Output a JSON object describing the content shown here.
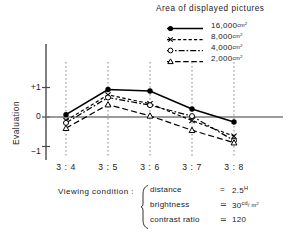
{
  "legend": {
    "title": "Area of displayed pictures",
    "entries": [
      {
        "label": "16,000",
        "unit": "cm",
        "unit_exp": "2",
        "marker": "filled-circle",
        "line_style": "solid",
        "color": "#000000"
      },
      {
        "label": "8,000",
        "unit": "cm",
        "unit_exp": "2",
        "marker": "cross",
        "line_style": "dashed",
        "color": "#000000"
      },
      {
        "label": "4,000",
        "unit": "cm",
        "unit_exp": "2",
        "marker": "open-circle",
        "line_style": "dash-dot",
        "color": "#000000"
      },
      {
        "label": "2,000",
        "unit": "cm",
        "unit_exp": "2",
        "marker": "open-triangle",
        "line_style": "long-dash",
        "color": "#000000"
      }
    ]
  },
  "axes": {
    "y_title": "Evaluation",
    "y_ticks": [
      "+1",
      "0",
      "−1"
    ],
    "y_tick_values": [
      1,
      0,
      -1
    ],
    "x_ticks": [
      "3 : 4",
      "3 : 5",
      "3 : 6",
      "3 : 7",
      "3 : 8"
    ]
  },
  "conditions": {
    "label": "Viewing condition :",
    "rows": [
      {
        "name": "distance",
        "relation": "=",
        "value": "2.5",
        "unit_sup": "H",
        "unit": ""
      },
      {
        "name": "brightness",
        "relation": "≃",
        "value": "30",
        "unit_sup": "cd",
        "unit": "/ m",
        "unit_exp": "2"
      },
      {
        "name": "contrast ratio",
        "relation": "≃",
        "value": "120",
        "unit_sup": "",
        "unit": ""
      }
    ]
  },
  "chart_data": {
    "type": "line",
    "title": "Area of displayed pictures",
    "xlabel": "",
    "ylabel": "Evaluation",
    "categories": [
      "3 : 4",
      "3 : 5",
      "3 : 6",
      "3 : 7",
      "3 : 8"
    ],
    "ylim": [
      -1.35,
      1.35
    ],
    "yticks": [
      -1,
      0,
      1
    ],
    "grid": "vertical-dotted",
    "legend_position": "top-right",
    "series": [
      {
        "name": "16,000cm2",
        "marker": "filled-circle",
        "line_style": "solid",
        "values": [
          0.08,
          0.93,
          0.88,
          0.27,
          -0.17
        ]
      },
      {
        "name": "8,000cm2",
        "marker": "cross",
        "line_style": "dashed",
        "values": [
          -0.12,
          0.75,
          0.45,
          -0.12,
          -0.65
        ]
      },
      {
        "name": "4,000cm2",
        "marker": "open-circle",
        "line_style": "dash-dot",
        "values": [
          -0.2,
          0.66,
          0.4,
          0.03,
          -0.8
        ]
      },
      {
        "name": "2,000cm2",
        "marker": "open-triangle",
        "line_style": "long-dash",
        "values": [
          -0.38,
          0.42,
          0.04,
          -0.45,
          -0.87
        ]
      }
    ]
  }
}
